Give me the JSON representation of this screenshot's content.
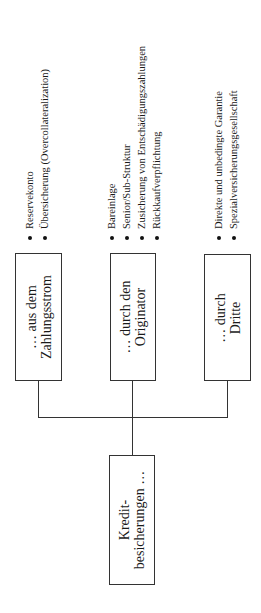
{
  "root": {
    "lines": [
      "Kredit-",
      "besicherungen …"
    ]
  },
  "branches": [
    {
      "lines": [
        "… aus dem",
        "Zahlungsstrom"
      ],
      "items": [
        "Reservekonto",
        "Übersicherung (Overcollateralization)"
      ]
    },
    {
      "lines": [
        "… durch den",
        "Originator"
      ],
      "items": [
        "Bareinlage",
        "Senior/Sub-Struktur",
        "Zusicherung von Entschädigungszahlungen",
        "Rückkaufverpflichtung"
      ]
    },
    {
      "lines": [
        "… durch",
        "Dritte"
      ],
      "items": [
        "Direkte und unbedingte Garantie",
        "Spezialversicherungsgesellschaft"
      ]
    }
  ]
}
